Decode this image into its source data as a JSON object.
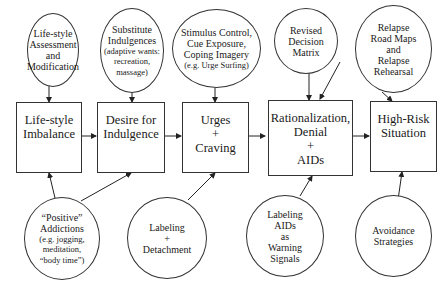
{
  "diagram": {
    "boxes": [
      {
        "id": "lifestyle-imbalance",
        "lines": [
          "Life-style",
          "Imbalance"
        ]
      },
      {
        "id": "desire-for-indulgence",
        "lines": [
          "Desire for",
          "Indulgence"
        ]
      },
      {
        "id": "urges-craving",
        "lines": [
          "Urges",
          "+",
          "Craving"
        ]
      },
      {
        "id": "rationalization",
        "lines": [
          "Rationalization,",
          "Denial",
          "+",
          "AIDs"
        ]
      },
      {
        "id": "high-risk-situation",
        "lines": [
          "High-Risk",
          "Situation"
        ]
      }
    ],
    "top_circles": [
      {
        "id": "lifestyle-assessment",
        "lines": [
          "Life-style",
          "Assessment",
          "and",
          "Modification"
        ],
        "small": []
      },
      {
        "id": "substitute-indulgences",
        "lines": [
          "Substitute",
          "Indulgences"
        ],
        "small": [
          "(adaptive wants:",
          "recreation,",
          "massage)"
        ]
      },
      {
        "id": "stimulus-control",
        "lines": [
          "Stimulus Control,",
          "Cue Exposure,",
          "Coping Imagery"
        ],
        "small": [
          "(e.g. Urge Surfing)"
        ]
      },
      {
        "id": "revised-decision-matrix",
        "lines": [
          "Revised",
          "Decision",
          "Matrix"
        ],
        "small": []
      },
      {
        "id": "relapse-road-maps",
        "lines": [
          "Relapse",
          "Road Maps",
          "and",
          "Relapse",
          "Rehearsal"
        ],
        "small": []
      }
    ],
    "bottom_circles": [
      {
        "id": "positive-addictions",
        "lines": [
          "“Positive”",
          "Addictions"
        ],
        "small": [
          "(e.g. jogging,",
          "meditation,",
          "“body time”)"
        ]
      },
      {
        "id": "labeling-detachment",
        "lines": [
          "Labeling",
          "+",
          "Detachment"
        ],
        "small": []
      },
      {
        "id": "labeling-aids",
        "lines": [
          "Labeling",
          "AIDs",
          "as",
          "Warning",
          "Signals"
        ],
        "small": []
      },
      {
        "id": "avoidance-strategies",
        "lines": [
          "Avoidance",
          "Strategies"
        ],
        "small": []
      }
    ]
  }
}
